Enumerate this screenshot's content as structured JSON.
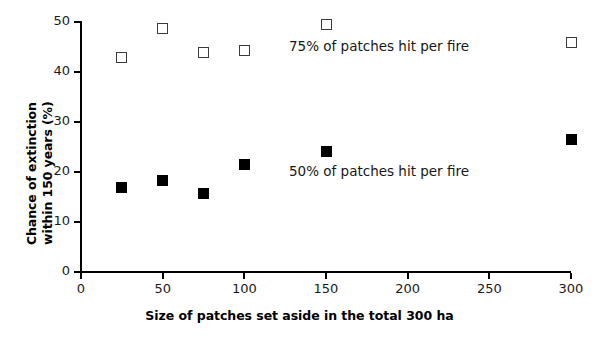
{
  "chart_data": {
    "type": "scatter",
    "title": "",
    "xlabel": "Size of patches set aside in the total 300 ha",
    "ylabel_line1": "Chance of extinction",
    "ylabel_line2": "within 150 years (%)",
    "ylabel": "Chance of extinction within 150 years (%)",
    "xlim": [
      0,
      300
    ],
    "ylim": [
      0,
      50
    ],
    "xticks": [
      0,
      50,
      100,
      150,
      200,
      250,
      300
    ],
    "yticks": [
      0,
      10,
      20,
      30,
      40,
      50
    ],
    "xtick_labels": [
      "0",
      "50",
      "100",
      "150",
      "200",
      "250",
      "300"
    ],
    "ytick_labels": [
      "0",
      "10",
      "20",
      "30",
      "40",
      "50"
    ],
    "grid": false,
    "legend_position": "inline-annotation",
    "series": [
      {
        "name": "75% of patches hit per fire",
        "marker": "open-square",
        "marker_color": "#3b3b3b",
        "x": [
          25,
          50,
          75,
          100,
          150,
          300
        ],
        "values": [
          43.0,
          48.8,
          44.0,
          44.3,
          49.5,
          46.0
        ]
      },
      {
        "name": "50% of patches hit per fire",
        "marker": "filled-square",
        "marker_color": "#000000",
        "x": [
          25,
          50,
          75,
          100,
          150,
          300
        ],
        "values": [
          17.0,
          18.3,
          15.8,
          21.5,
          24.2,
          26.6
        ]
      }
    ],
    "annotations": [
      {
        "text": "75% of patches hit per fire",
        "x": 128,
        "y": 45.5
      },
      {
        "text": "50% of patches hit per fire",
        "x": 128,
        "y": 20.5
      }
    ]
  }
}
